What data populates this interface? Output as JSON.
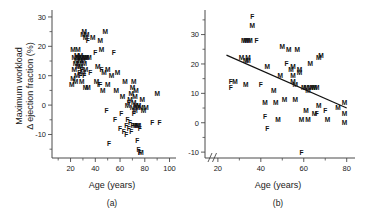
{
  "figure": {
    "panels": [
      {
        "id": "a",
        "caption": "(a)",
        "xlabel": "Age (years)",
        "ylabel_line1": "Maximum workload",
        "ylabel_line2": "Δ ejection fraction (%)"
      },
      {
        "id": "b",
        "caption": "(b)",
        "xlabel": "Age (years)",
        "ylabel_line1": "",
        "ylabel_line2": ""
      }
    ]
  },
  "chart_data": [
    {
      "type": "scatter",
      "panel": "a",
      "title": "",
      "xlabel": "Age (years)",
      "ylabel": "Maximum workload Δ ejection fraction (%)",
      "xlim": [
        5,
        102
      ],
      "ylim": [
        -18,
        31
      ],
      "xticks": [
        20,
        40,
        60,
        80,
        100
      ],
      "xtick_labels": [
        "20",
        "40",
        "60",
        "80",
        "100"
      ],
      "yticks": [
        -10,
        0,
        10,
        20,
        30
      ],
      "ytick_labels": [
        "-10",
        "0",
        "10",
        "20",
        "30"
      ],
      "minor_tick_step": 5,
      "grid": false,
      "legend": false,
      "axis_break": false,
      "regression_line": null,
      "marker_labels": [
        "M",
        "F"
      ],
      "points": [
        {
          "x": 21,
          "y": 7,
          "label": "M"
        },
        {
          "x": 22,
          "y": 9,
          "label": "M"
        },
        {
          "x": 22,
          "y": 19,
          "label": "M"
        },
        {
          "x": 23,
          "y": 12,
          "label": "M"
        },
        {
          "x": 23,
          "y": 16,
          "label": "M"
        },
        {
          "x": 24,
          "y": 8,
          "label": "M"
        },
        {
          "x": 24,
          "y": 14,
          "label": "M"
        },
        {
          "x": 25,
          "y": 10,
          "label": "M"
        },
        {
          "x": 25,
          "y": 15,
          "label": "M"
        },
        {
          "x": 25,
          "y": 17,
          "label": "M"
        },
        {
          "x": 26,
          "y": 13,
          "label": "M"
        },
        {
          "x": 26,
          "y": 16,
          "label": "M"
        },
        {
          "x": 26,
          "y": 19,
          "label": "M"
        },
        {
          "x": 27,
          "y": 11,
          "label": "F"
        },
        {
          "x": 27,
          "y": 14,
          "label": "M"
        },
        {
          "x": 27,
          "y": 16,
          "label": "M"
        },
        {
          "x": 28,
          "y": 10,
          "label": "F"
        },
        {
          "x": 28,
          "y": 13,
          "label": "M"
        },
        {
          "x": 28,
          "y": 15,
          "label": "M"
        },
        {
          "x": 28,
          "y": 17,
          "label": "M"
        },
        {
          "x": 29,
          "y": 8,
          "label": "M"
        },
        {
          "x": 29,
          "y": 12,
          "label": "F"
        },
        {
          "x": 29,
          "y": 16,
          "label": "M"
        },
        {
          "x": 30,
          "y": 11,
          "label": "M"
        },
        {
          "x": 30,
          "y": 15,
          "label": "M"
        },
        {
          "x": 30,
          "y": 24,
          "label": "M"
        },
        {
          "x": 31,
          "y": 10,
          "label": "F"
        },
        {
          "x": 31,
          "y": 14,
          "label": "M"
        },
        {
          "x": 31,
          "y": 16,
          "label": "M"
        },
        {
          "x": 31,
          "y": 25,
          "label": "M"
        },
        {
          "x": 32,
          "y": 6,
          "label": "M"
        },
        {
          "x": 32,
          "y": 12,
          "label": "M"
        },
        {
          "x": 32,
          "y": 16,
          "label": "M"
        },
        {
          "x": 32,
          "y": 23,
          "label": "M"
        },
        {
          "x": 33,
          "y": 16,
          "label": "M"
        },
        {
          "x": 33,
          "y": 24,
          "label": "M"
        },
        {
          "x": 34,
          "y": 6,
          "label": "M"
        },
        {
          "x": 34,
          "y": 22,
          "label": "F"
        },
        {
          "x": 35,
          "y": 16,
          "label": "M"
        },
        {
          "x": 36,
          "y": 11,
          "label": "F"
        },
        {
          "x": 38,
          "y": 23,
          "label": "M"
        },
        {
          "x": 40,
          "y": 18,
          "label": "F"
        },
        {
          "x": 41,
          "y": 8,
          "label": "M"
        },
        {
          "x": 42,
          "y": 13,
          "label": "M"
        },
        {
          "x": 43,
          "y": 7,
          "label": "F"
        },
        {
          "x": 44,
          "y": 7,
          "label": "F"
        },
        {
          "x": 44,
          "y": 22,
          "label": "M"
        },
        {
          "x": 45,
          "y": 12,
          "label": "F"
        },
        {
          "x": 45,
          "y": 19,
          "label": "M"
        },
        {
          "x": 46,
          "y": 5,
          "label": "M"
        },
        {
          "x": 47,
          "y": 11,
          "label": "M"
        },
        {
          "x": 48,
          "y": 25,
          "label": "M"
        },
        {
          "x": 49,
          "y": -2,
          "label": "F"
        },
        {
          "x": 50,
          "y": 7,
          "label": "M"
        },
        {
          "x": 50,
          "y": 12,
          "label": "M"
        },
        {
          "x": 51,
          "y": -13,
          "label": "F"
        },
        {
          "x": 53,
          "y": 10,
          "label": "M"
        },
        {
          "x": 55,
          "y": 18,
          "label": "F"
        },
        {
          "x": 56,
          "y": -5,
          "label": "F"
        },
        {
          "x": 57,
          "y": 5,
          "label": "M"
        },
        {
          "x": 58,
          "y": 11,
          "label": "M"
        },
        {
          "x": 60,
          "y": -8,
          "label": "F"
        },
        {
          "x": 61,
          "y": -3,
          "label": "F"
        },
        {
          "x": 62,
          "y": 3,
          "label": "M"
        },
        {
          "x": 63,
          "y": -9,
          "label": "F"
        },
        {
          "x": 64,
          "y": 8,
          "label": "M"
        },
        {
          "x": 65,
          "y": -7,
          "label": "F"
        },
        {
          "x": 65,
          "y": -10,
          "label": "F"
        },
        {
          "x": 66,
          "y": -5,
          "label": "F"
        },
        {
          "x": 66,
          "y": 0,
          "label": "M"
        },
        {
          "x": 67,
          "y": -8,
          "label": "F"
        },
        {
          "x": 67,
          "y": 1,
          "label": "F"
        },
        {
          "x": 68,
          "y": -6,
          "label": "F"
        },
        {
          "x": 68,
          "y": 2,
          "label": "M"
        },
        {
          "x": 69,
          "y": -9,
          "label": "F"
        },
        {
          "x": 69,
          "y": 4,
          "label": "M"
        },
        {
          "x": 70,
          "y": -1,
          "label": "M"
        },
        {
          "x": 70,
          "y": -7,
          "label": "F"
        },
        {
          "x": 70,
          "y": 6,
          "label": "M"
        },
        {
          "x": 71,
          "y": -3,
          "label": "F"
        },
        {
          "x": 71,
          "y": 1,
          "label": "M"
        },
        {
          "x": 71,
          "y": 8,
          "label": "M"
        },
        {
          "x": 72,
          "y": -7,
          "label": "M"
        },
        {
          "x": 72,
          "y": -2,
          "label": "M"
        },
        {
          "x": 72,
          "y": 3,
          "label": "M"
        },
        {
          "x": 73,
          "y": -7,
          "label": "F"
        },
        {
          "x": 73,
          "y": 0,
          "label": "M"
        },
        {
          "x": 73,
          "y": 5,
          "label": "M"
        },
        {
          "x": 74,
          "y": -7,
          "label": "M"
        },
        {
          "x": 74,
          "y": -1,
          "label": "M"
        },
        {
          "x": 74,
          "y": -12,
          "label": "F"
        },
        {
          "x": 75,
          "y": -7,
          "label": "M"
        },
        {
          "x": 75,
          "y": 0,
          "label": "M"
        },
        {
          "x": 75,
          "y": -15,
          "label": "F"
        },
        {
          "x": 76,
          "y": -8,
          "label": "F"
        },
        {
          "x": 76,
          "y": -16,
          "label": "F"
        },
        {
          "x": 77,
          "y": -1,
          "label": "M"
        },
        {
          "x": 77,
          "y": -16,
          "label": "M"
        },
        {
          "x": 78,
          "y": 2,
          "label": "M"
        },
        {
          "x": 79,
          "y": -2,
          "label": "M"
        },
        {
          "x": 81,
          "y": -1,
          "label": "M"
        },
        {
          "x": 86,
          "y": -6,
          "label": "F"
        },
        {
          "x": 90,
          "y": 4,
          "label": "M"
        },
        {
          "x": 92,
          "y": -6,
          "label": "F"
        }
      ]
    },
    {
      "type": "scatter",
      "panel": "b",
      "title": "",
      "xlabel": "Age (years)",
      "ylabel": "",
      "xlim": [
        14,
        82
      ],
      "ylim": [
        -12,
        37
      ],
      "xticks": [
        20,
        40,
        60,
        80
      ],
      "xtick_labels": [
        "20",
        "40",
        "60",
        "80"
      ],
      "yticks": [
        -10,
        0,
        10,
        20,
        30
      ],
      "ytick_labels": [
        "-10",
        "0",
        "10",
        "20",
        "30"
      ],
      "minor_tick_step": 5,
      "grid": false,
      "legend": false,
      "axis_break": true,
      "axis_break_note": "x-axis broken between 0 and 20",
      "regression_line": {
        "x1": 24,
        "y1": 23,
        "x2": 80,
        "y2": 5
      },
      "marker_labels": [
        "M",
        "F"
      ],
      "points": [
        {
          "x": 26,
          "y": 14,
          "label": "F"
        },
        {
          "x": 26,
          "y": 12,
          "label": "F"
        },
        {
          "x": 28,
          "y": 14,
          "label": "M"
        },
        {
          "x": 31,
          "y": 22,
          "label": "M"
        },
        {
          "x": 32,
          "y": 28,
          "label": "M"
        },
        {
          "x": 33,
          "y": 28,
          "label": "M"
        },
        {
          "x": 33,
          "y": 21,
          "label": "M"
        },
        {
          "x": 33,
          "y": 13,
          "label": "M"
        },
        {
          "x": 34,
          "y": 28,
          "label": "M"
        },
        {
          "x": 34,
          "y": 21,
          "label": "M"
        },
        {
          "x": 34,
          "y": 22,
          "label": "M"
        },
        {
          "x": 35,
          "y": 28,
          "label": "M"
        },
        {
          "x": 36,
          "y": 36,
          "label": "F"
        },
        {
          "x": 36,
          "y": 33,
          "label": "M"
        },
        {
          "x": 38,
          "y": 28,
          "label": "F"
        },
        {
          "x": 40,
          "y": 13,
          "label": "F"
        },
        {
          "x": 42,
          "y": 7,
          "label": "M"
        },
        {
          "x": 42,
          "y": 2,
          "label": "F"
        },
        {
          "x": 43,
          "y": 19,
          "label": "M"
        },
        {
          "x": 43,
          "y": -2,
          "label": "F"
        },
        {
          "x": 46,
          "y": 11,
          "label": "M"
        },
        {
          "x": 47,
          "y": 7,
          "label": "M"
        },
        {
          "x": 48,
          "y": 1,
          "label": "M"
        },
        {
          "x": 49,
          "y": 16,
          "label": "M"
        },
        {
          "x": 50,
          "y": 26,
          "label": "M"
        },
        {
          "x": 51,
          "y": 8,
          "label": "M"
        },
        {
          "x": 52,
          "y": 20,
          "label": "F"
        },
        {
          "x": 53,
          "y": 25,
          "label": "M"
        },
        {
          "x": 54,
          "y": 18,
          "label": "M"
        },
        {
          "x": 55,
          "y": 16,
          "label": "M"
        },
        {
          "x": 55,
          "y": 14,
          "label": "M"
        },
        {
          "x": 55,
          "y": 19,
          "label": "M"
        },
        {
          "x": 56,
          "y": 13,
          "label": "M"
        },
        {
          "x": 56,
          "y": 8,
          "label": "M"
        },
        {
          "x": 57,
          "y": 25,
          "label": "M"
        },
        {
          "x": 58,
          "y": 18,
          "label": "M"
        },
        {
          "x": 58,
          "y": 17,
          "label": "M"
        },
        {
          "x": 59,
          "y": 1,
          "label": "M"
        },
        {
          "x": 59,
          "y": -10,
          "label": "F"
        },
        {
          "x": 60,
          "y": 12,
          "label": "M"
        },
        {
          "x": 61,
          "y": 12,
          "label": "M"
        },
        {
          "x": 61,
          "y": 4,
          "label": "M"
        },
        {
          "x": 62,
          "y": 11,
          "label": "M"
        },
        {
          "x": 62,
          "y": 1,
          "label": "M"
        },
        {
          "x": 63,
          "y": 12,
          "label": "M"
        },
        {
          "x": 63,
          "y": 20,
          "label": "M"
        },
        {
          "x": 64,
          "y": 12,
          "label": "M"
        },
        {
          "x": 65,
          "y": 12,
          "label": "M"
        },
        {
          "x": 65,
          "y": 3,
          "label": "M"
        },
        {
          "x": 66,
          "y": 12,
          "label": "M"
        },
        {
          "x": 66,
          "y": 3,
          "label": "F"
        },
        {
          "x": 67,
          "y": 6,
          "label": "M"
        },
        {
          "x": 67,
          "y": 22,
          "label": "M"
        },
        {
          "x": 68,
          "y": 23,
          "label": "M"
        },
        {
          "x": 70,
          "y": 4,
          "label": "F"
        },
        {
          "x": 71,
          "y": 1,
          "label": "M"
        },
        {
          "x": 76,
          "y": 5,
          "label": "M"
        },
        {
          "x": 79,
          "y": 7,
          "label": "M"
        },
        {
          "x": 79,
          "y": 3,
          "label": "M"
        },
        {
          "x": 79,
          "y": 0,
          "label": "M"
        }
      ]
    }
  ]
}
